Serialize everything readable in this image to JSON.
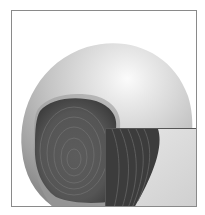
{
  "image": {
    "subject": "pencil-illustration-of-round-fruit-with-dark-ringed-lesion",
    "inset": "magnified-detail-of-lesion-edge",
    "colors": {
      "background": "#ffffff",
      "frame_border": "#8a8a8a",
      "fruit_light": "#e6e6e6",
      "fruit_mid": "#b8b8b8",
      "fruit_shadow": "#8c8c8c",
      "lesion_dark": "#4a4a4a",
      "lesion_rings": "#6e6e6e",
      "highlight": "#fafafa"
    }
  }
}
